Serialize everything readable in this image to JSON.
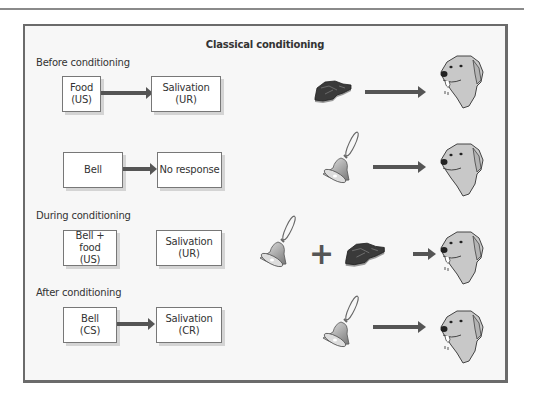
{
  "figure": {
    "title": "Classical conditioning",
    "stages": [
      {
        "label": "Before conditioning",
        "stimulus": {
          "line1": "Food",
          "line2": "(US)"
        },
        "response": {
          "line1": "Salivation",
          "line2": "(UR)"
        },
        "has_arrow": true,
        "illustration": [
          "meat-icon",
          "arrow",
          "dog-salivating-icon"
        ]
      },
      {
        "label": "",
        "stimulus": {
          "line1": "Bell",
          "line2": ""
        },
        "response": {
          "line1": "No response",
          "line2": ""
        },
        "has_arrow": true,
        "illustration": [
          "bell-icon",
          "arrow",
          "dog-icon"
        ]
      },
      {
        "label": "During conditioning",
        "stimulus": {
          "line1": "Bell + food",
          "line2": "(US)"
        },
        "response": {
          "line1": "Salivation",
          "line2": "(UR)"
        },
        "has_arrow": false,
        "illustration": [
          "bell-icon",
          "plus",
          "meat-icon",
          "arrow",
          "dog-salivating-icon"
        ]
      },
      {
        "label": "After conditioning",
        "stimulus": {
          "line1": "Bell",
          "line2": "(CS)"
        },
        "response": {
          "line1": "Salivation",
          "line2": "(CR)"
        },
        "has_arrow": true,
        "illustration": [
          "bell-icon",
          "arrow",
          "dog-salivating-icon"
        ]
      }
    ],
    "plus_symbol": "+"
  },
  "colors": {
    "frame_border": "#6b6b6b",
    "frame_bg": "#f7f7f7",
    "arrow": "#555555",
    "dog_fill": "#c8c8c8",
    "meat_fill": "#3a3a3a"
  }
}
